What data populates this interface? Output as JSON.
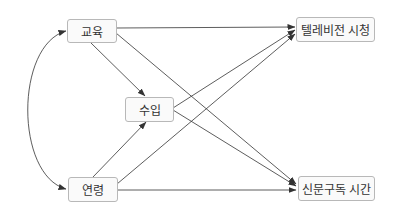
{
  "diagram": {
    "type": "path-diagram",
    "nodes": [
      {
        "id": "education",
        "label": "교육"
      },
      {
        "id": "income",
        "label": "수입"
      },
      {
        "id": "age",
        "label": "연령"
      },
      {
        "id": "tv",
        "label": "텔레비전 시청"
      },
      {
        "id": "newspaper",
        "label": "신문구독 시간"
      }
    ],
    "edges": [
      {
        "from": "education",
        "to": "tv",
        "type": "directed"
      },
      {
        "from": "education",
        "to": "newspaper",
        "type": "directed"
      },
      {
        "from": "education",
        "to": "income",
        "type": "directed"
      },
      {
        "from": "income",
        "to": "tv",
        "type": "directed"
      },
      {
        "from": "income",
        "to": "newspaper",
        "type": "directed"
      },
      {
        "from": "age",
        "to": "income",
        "type": "directed"
      },
      {
        "from": "age",
        "to": "tv",
        "type": "directed"
      },
      {
        "from": "age",
        "to": "newspaper",
        "type": "directed"
      },
      {
        "from": "education",
        "to": "age",
        "type": "bidirectional-curved"
      }
    ],
    "colors": {
      "edge": "#333333",
      "node_border": "#b8b8b8",
      "node_fill": "#fafafa",
      "text": "#333333"
    }
  }
}
